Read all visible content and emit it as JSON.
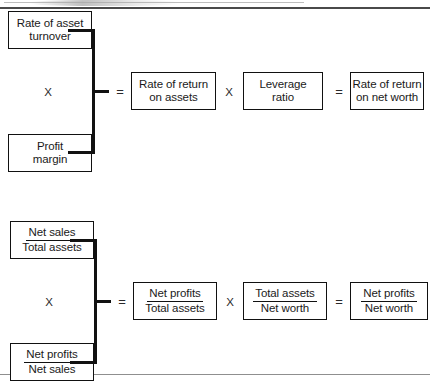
{
  "page": {
    "title": "Du Pont system of financial analysis",
    "background": "#ffffff",
    "line_color": "#111111"
  },
  "operators": {
    "times": "X",
    "equals": "="
  },
  "diagrams": [
    {
      "id": "top-diagram",
      "inputs": [
        {
          "id": "rate-of-asset-turnover",
          "line1": "Rate of asset",
          "line2": "turnover"
        },
        {
          "id": "profit-margin",
          "line1": "Profit",
          "line2": "margin"
        }
      ],
      "chain": [
        {
          "id": "rate-of-return-on-assets",
          "line1": "Rate of return",
          "line2": "on assets"
        },
        {
          "id": "leverage-ratio",
          "line1": "Leverage",
          "line2": "ratio"
        },
        {
          "id": "rate-of-return-on-net-worth",
          "line1": "Rate of return",
          "line2": "on net worth"
        }
      ]
    },
    {
      "id": "bottom-diagram",
      "inputs": [
        {
          "id": "net-sales-over-total-assets",
          "numerator": "Net sales",
          "denominator": "Total assets"
        },
        {
          "id": "net-profits-over-net-sales",
          "numerator": "Net profits",
          "denominator": "Net sales"
        }
      ],
      "chain": [
        {
          "id": "net-profits-over-total-assets",
          "numerator": "Net profits",
          "denominator": "Total assets"
        },
        {
          "id": "total-assets-over-net-worth",
          "numerator": "Total assets",
          "denominator": "Net worth"
        },
        {
          "id": "net-profits-over-net-worth",
          "numerator": "Net profits",
          "denominator": "Net worth"
        }
      ]
    }
  ]
}
